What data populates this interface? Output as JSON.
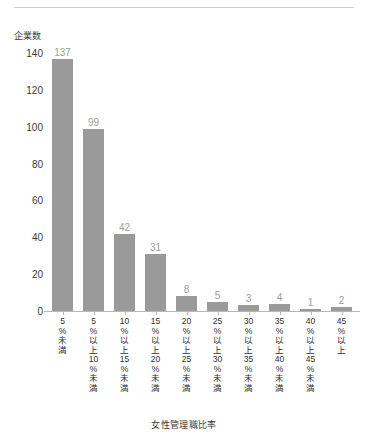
{
  "chart_data": {
    "type": "bar",
    "title": "",
    "xlabel": "女性管理職比率",
    "ylabel": "企業数",
    "ylim": [
      0,
      140
    ],
    "ytick_step": 20,
    "grid": false,
    "legend": false,
    "bar_color": "#9a9a9a",
    "value_label_color": "#9d9d9d",
    "axis_color": "#b6b6b6",
    "categories": [
      "5%未満",
      "5%以上10%未満",
      "10%以上15%未満",
      "15%以上20%未満",
      "20%以上25%未満",
      "25%以上30%未満",
      "30%以上35%未満",
      "35%以上40%未満",
      "40%以上45%未満",
      "45%以上"
    ],
    "category_chars": [
      [
        "5",
        "%",
        "未",
        "満"
      ],
      [
        "5",
        "%",
        "以",
        "上",
        "10",
        "%",
        "未",
        "満"
      ],
      [
        "10",
        "%",
        "以",
        "上",
        "15",
        "%",
        "未",
        "満"
      ],
      [
        "15",
        "%",
        "以",
        "上",
        "20",
        "%",
        "未",
        "満"
      ],
      [
        "20",
        "%",
        "以",
        "上",
        "25",
        "%",
        "未",
        "満"
      ],
      [
        "25",
        "%",
        "以",
        "上",
        "30",
        "%",
        "未",
        "満"
      ],
      [
        "30",
        "%",
        "以",
        "上",
        "35",
        "%",
        "未",
        "満"
      ],
      [
        "35",
        "%",
        "以",
        "上",
        "40",
        "%",
        "未",
        "満"
      ],
      [
        "40",
        "%",
        "以",
        "上",
        "45",
        "%",
        "未",
        "満"
      ],
      [
        "45",
        "%",
        "以",
        "上"
      ]
    ],
    "values": [
      137,
      99,
      42,
      31,
      8,
      5,
      3,
      4,
      1,
      2
    ],
    "yticks": [
      0,
      20,
      40,
      60,
      80,
      100,
      120,
      140
    ]
  }
}
